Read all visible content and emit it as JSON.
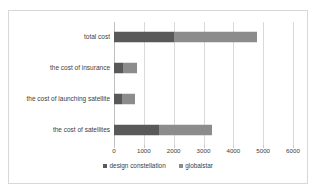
{
  "chart_data": {
    "type": "bar",
    "orientation": "horizontal",
    "title": "",
    "xlabel": "",
    "ylabel": "",
    "categories": [
      "total cost",
      "the cost of insurance",
      "the cost of launching satellite",
      "the cost of satellites"
    ],
    "series": [
      {
        "name": "design constellation",
        "color": "#595959",
        "values": [
          2000,
          300,
          280,
          1500
        ]
      },
      {
        "name": "globalstar",
        "color": "#8c8c8c",
        "values": [
          2800,
          480,
          420,
          1800
        ]
      }
    ],
    "stacked": true,
    "totals": [
      4800,
      780,
      700,
      3300
    ],
    "xlim": [
      0,
      6000
    ],
    "xticks": [
      0,
      1000,
      2000,
      3000,
      4000,
      5000,
      6000
    ],
    "xtick_labels": [
      "0",
      "1000",
      "2000",
      "3000",
      "4000",
      "5000",
      "6000"
    ],
    "grid": "vertical",
    "legend_position": "bottom",
    "legend": [
      "design constellation",
      "globalstar"
    ]
  },
  "legend": {
    "items": [
      {
        "label": "design constellation",
        "color": "#595959",
        "marker": "square-marker"
      },
      {
        "label": "globalstar",
        "color": "#8c8c8c",
        "marker": "square-marker"
      }
    ]
  }
}
